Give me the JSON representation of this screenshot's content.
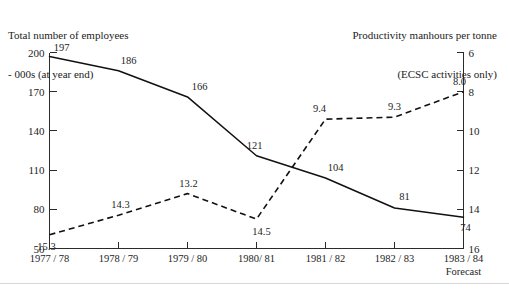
{
  "titles": {
    "left_line1": "Total number of employees",
    "left_line2": "- 000s (at year end)",
    "right_line1": "Productivity manhours per tonne",
    "right_line2": "(ECSC activities only)"
  },
  "footnote": "Forecast",
  "chart_data": {
    "type": "line",
    "title": "",
    "categories": [
      "1977 / 78",
      "1978 / 79",
      "1979 / 80",
      "1980/ 81",
      "1981 / 82",
      "1982 / 83",
      "1983 / 84"
    ],
    "xlabel": "",
    "grid": false,
    "legend": "none",
    "series": [
      {
        "name": "Total number of employees - 000s (at year end)",
        "style": "solid",
        "axis": "left",
        "values": [
          197,
          186,
          166,
          121,
          104,
          81,
          74
        ],
        "labels": [
          "197",
          "186",
          "166",
          "121",
          "104",
          "81",
          "74"
        ]
      },
      {
        "name": "Productivity manhours per tonne (ECSC activities only)",
        "style": "dashed",
        "axis": "right",
        "values": [
          15.3,
          14.3,
          13.2,
          14.5,
          9.4,
          9.3,
          8.0
        ],
        "labels": [
          "15.3",
          "14.3",
          "13.2",
          "14.5",
          "9.4",
          "9.3",
          "8.0"
        ]
      }
    ],
    "axes": {
      "left": {
        "label": "Total number of employees - 000s (at year end)",
        "ticks": [
          200,
          170,
          140,
          110,
          80,
          50
        ],
        "tick_labels": [
          "200",
          "170",
          "140",
          "110",
          "80",
          "50"
        ],
        "ylim": [
          50,
          200
        ],
        "inverted": false
      },
      "right": {
        "label": "Productivity manhours per tonne (ECSC activities only)",
        "ticks": [
          6,
          8,
          10,
          12,
          14,
          16
        ],
        "tick_labels": [
          "6",
          "8",
          "10",
          "12",
          "14",
          "16"
        ],
        "ylim": [
          6,
          16
        ],
        "inverted": true
      }
    }
  },
  "colors": {
    "line": "#111111",
    "axis": "#2b2b2b",
    "text": "#242424",
    "background": "#ffffff"
  }
}
